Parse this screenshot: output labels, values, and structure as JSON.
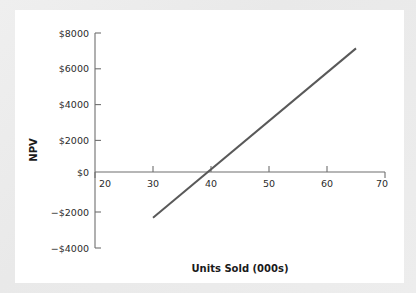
{
  "chart_data": {
    "type": "line",
    "title": "",
    "xlabel": "Units Sold (000s)",
    "ylabel": "NPV",
    "xlim": [
      20,
      70
    ],
    "ylim": [
      -4000,
      8000
    ],
    "grid": false,
    "legend": "none",
    "x_ticks": [
      20,
      30,
      40,
      50,
      60,
      70
    ],
    "x_tick_labels": [
      "20",
      "30",
      "40",
      "50",
      "60",
      "70"
    ],
    "y_ticks": [
      -4000,
      -2000,
      0,
      2000,
      4000,
      6000,
      8000
    ],
    "y_tick_labels": [
      "−$4000",
      "−$2000",
      "$0",
      "$2000",
      "$4000",
      "$6000",
      "$8000"
    ],
    "series": [
      {
        "name": "NPV",
        "color": "#595959",
        "x": [
          30,
          65
        ],
        "values": [
          -2550,
          6900
        ]
      }
    ],
    "breakeven_units": 39.5,
    "annotations": []
  },
  "axis_labels": {
    "x_title": "Units Sold (000s)",
    "y_title": "NPV"
  },
  "colors": {
    "line": "#595959",
    "axis": "#6f6f6f",
    "text": "#1a1a1a",
    "panel_background": "#ffffff",
    "figure_background": "#ececec"
  }
}
